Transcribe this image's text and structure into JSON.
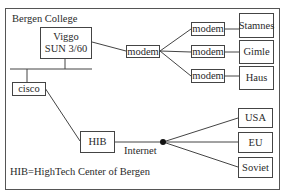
{
  "diagram": {
    "title": "Bergen College",
    "caption": "HIB=HighTech Center of Bergen",
    "internet_label": "Internet",
    "nodes": {
      "viggo": {
        "line1": "Viggo",
        "line2": "SUN 3/60"
      },
      "cisco": {
        "label": "cisco"
      },
      "hib": {
        "label": "HIB"
      },
      "modem_central": {
        "label": "modem"
      },
      "modem_stamnes": {
        "label": "modem"
      },
      "modem_gimle": {
        "label": "modem"
      },
      "modem_haus": {
        "label": "modem"
      },
      "stamnes": {
        "label": "Stamnes"
      },
      "gimle": {
        "label": "Gimle"
      },
      "haus": {
        "label": "Haus"
      },
      "usa": {
        "label": "USA"
      },
      "eu": {
        "label": "EU"
      },
      "soviet": {
        "label": "Soviet"
      }
    },
    "colors": {
      "line": "#444444",
      "text": "#2a2a2a",
      "background": "#ffffff"
    }
  }
}
